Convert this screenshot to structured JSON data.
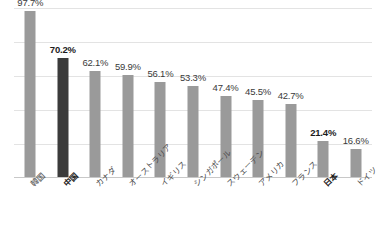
{
  "chart_data": {
    "type": "bar",
    "title": "",
    "subtitle": "",
    "xlabel": "",
    "ylabel": "",
    "ylim": [
      0,
      100
    ],
    "grid": true,
    "gridlines": [
      20,
      40,
      60,
      80,
      100
    ],
    "legend": "none",
    "axis_tick_labels_visible": false,
    "categories": [
      "韓国",
      "中国",
      "カナダ",
      "オーストラリア",
      "イギリス",
      "シンガポール",
      "スウェーデン",
      "アメリカ",
      "フランス",
      "日本",
      "ドイツ"
    ],
    "values": [
      97.7,
      70.2,
      62.1,
      59.9,
      56.1,
      53.3,
      47.4,
      45.5,
      42.7,
      21.4,
      16.6
    ],
    "data_labels": [
      "97.7%",
      "70.2%",
      "62.1%",
      "59.9%",
      "56.1%",
      "53.3%",
      "47.4%",
      "45.5%",
      "42.7%",
      "21.4%",
      "16.6%"
    ],
    "label_emphasis": [
      false,
      true,
      false,
      false,
      false,
      false,
      false,
      false,
      false,
      true,
      false
    ],
    "bar_emphasis": [
      false,
      true,
      false,
      false,
      false,
      false,
      false,
      false,
      false,
      false,
      false
    ],
    "colors": {
      "bar_default": "#9a9a9a",
      "bar_highlight": "#3b3b3b",
      "gridline": "#e3e3e3",
      "baseline": "#c8c8c8",
      "label_text": "#3a3a3a",
      "label_text_bold": "#1c1c1c",
      "category_text": "#4a4a4a",
      "background": "#ffffff"
    }
  }
}
